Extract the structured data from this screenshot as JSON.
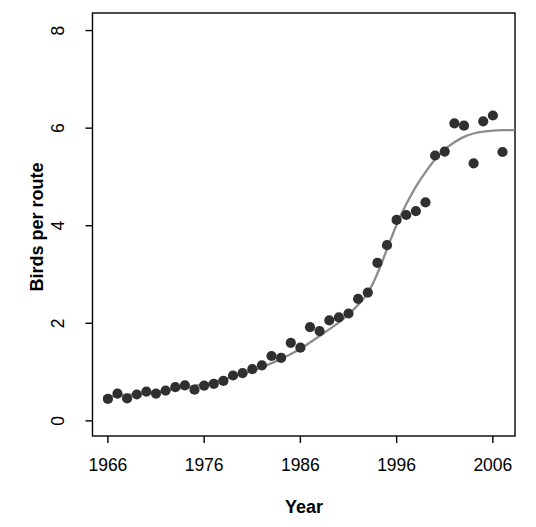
{
  "figure": {
    "width": 536,
    "height": 527,
    "background": "#ffffff"
  },
  "chart_data": {
    "type": "scatter",
    "title": "",
    "xlabel": "Year",
    "ylabel": "Birds per route",
    "xlim": [
      1964.4,
      2008.3
    ],
    "ylim": [
      -0.31,
      8.36
    ],
    "x_ticks": [
      1966,
      1976,
      1986,
      1996,
      2006
    ],
    "x_tick_labels": [
      "1966",
      "1976",
      "1986",
      "1996",
      "2006"
    ],
    "y_ticks": [
      0,
      2,
      4,
      6,
      8
    ],
    "y_tick_labels": [
      "0",
      "2",
      "4",
      "6",
      "8"
    ],
    "grid": false,
    "legend_position": "none",
    "series": [
      {
        "name": "observed-birds-per-route",
        "type": "scatter",
        "color": "#303030",
        "x": [
          1966,
          1967,
          1968,
          1969,
          1970,
          1971,
          1972,
          1973,
          1974,
          1975,
          1976,
          1977,
          1978,
          1979,
          1980,
          1981,
          1982,
          1983,
          1984,
          1985,
          1986,
          1987,
          1988,
          1989,
          1990,
          1991,
          1992,
          1993,
          1994,
          1995,
          1996,
          1997,
          1998,
          1999,
          2000,
          2001,
          2002,
          2003,
          2004,
          2005,
          2006,
          2007
        ],
        "y": [
          0.45,
          0.56,
          0.46,
          0.54,
          0.6,
          0.56,
          0.62,
          0.69,
          0.73,
          0.64,
          0.72,
          0.76,
          0.82,
          0.93,
          0.98,
          1.06,
          1.14,
          1.33,
          1.29,
          1.6,
          1.5,
          1.92,
          1.84,
          2.06,
          2.12,
          2.2,
          2.5,
          2.63,
          3.24,
          3.6,
          4.12,
          4.22,
          4.3,
          4.48,
          5.44,
          5.52,
          6.1,
          6.05,
          5.28,
          6.14,
          6.26,
          5.51
        ]
      },
      {
        "name": "fitted-logistic-trend",
        "type": "line",
        "color": "#8c8c8c",
        "x": [
          1965.6,
          1968,
          1970,
          1972,
          1974,
          1976,
          1978,
          1980,
          1982,
          1984,
          1986,
          1988,
          1990,
          1991,
          1992,
          1993,
          1994,
          1995,
          1996,
          1997,
          1998,
          1999,
          2000,
          2001,
          2002,
          2003,
          2004,
          2005,
          2006,
          2007,
          2008.2
        ],
        "y": [
          0.49,
          0.53,
          0.57,
          0.62,
          0.68,
          0.76,
          0.85,
          0.96,
          1.1,
          1.27,
          1.48,
          1.74,
          2.02,
          2.18,
          2.38,
          2.62,
          3.02,
          3.52,
          4.02,
          4.44,
          4.8,
          5.1,
          5.36,
          5.56,
          5.71,
          5.82,
          5.89,
          5.93,
          5.95,
          5.96,
          5.96
        ]
      }
    ]
  },
  "style": {
    "axis_color": "#000000",
    "point_color": "#303030",
    "point_radius": 5.1,
    "curve_color": "#8c8c8c",
    "curve_width": 2.3,
    "axis_line_width": 1.4,
    "tick_length": 7,
    "plot_box": {
      "left": 92.5,
      "top": 13,
      "right": 515,
      "bottom": 436
    },
    "y_tick_label_x": 58,
    "x_tick_label_y": 471,
    "x_title_pos": {
      "x": 304,
      "y": 513
    },
    "y_title_pos": {
      "x": 37,
      "y": 227
    }
  }
}
